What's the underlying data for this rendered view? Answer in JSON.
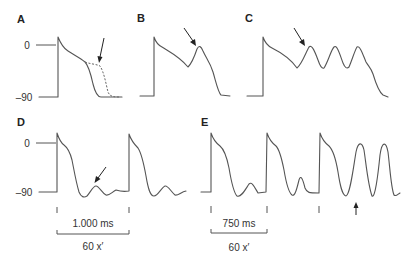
{
  "figure": {
    "colors": {
      "trace": "#555555",
      "arrow": "#222222",
      "text": "#333333",
      "background": "#ffffff"
    },
    "panels": [
      {
        "id": "A",
        "label": "A",
        "y_axis": {
          "ticks": [
            "0",
            "–90"
          ]
        },
        "description": "Single action potential with prolonged repolarization (dashed) indicated by arrow"
      },
      {
        "id": "B",
        "label": "B",
        "description": "Action potential with a single early afterdepolarization during phase 3 (arrow)"
      },
      {
        "id": "C",
        "label": "C",
        "description": "Action potential with repetitive early afterdepolarizations (arrow)"
      },
      {
        "id": "D",
        "label": "D",
        "y_axis": {
          "ticks": [
            "0",
            "–90"
          ]
        },
        "scale": {
          "interval": "1.000 ms",
          "rate": "60 x′"
        },
        "description": "Two action potentials each followed by a delayed afterdepolarization (arrow)"
      },
      {
        "id": "E",
        "label": "E",
        "scale": {
          "interval": "750 ms",
          "rate": "60 x′"
        },
        "description": "Shorter cycle length; delayed afterdepolarizations grow and trigger activity (arrow)"
      }
    ]
  }
}
